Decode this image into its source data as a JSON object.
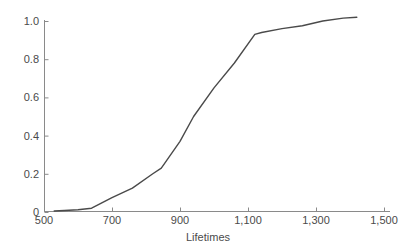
{
  "chart_data": {
    "type": "line",
    "title": "",
    "subtitle": "",
    "xlabel": "Lifetimes",
    "ylabel": "",
    "xlim": [
      500,
      1500
    ],
    "ylim": [
      0,
      1.04
    ],
    "grid": false,
    "legend": null,
    "legend_position": "none",
    "line_color": "#4a4a4a",
    "axis_color": "#8a8a8a",
    "x_ticks": [
      500,
      700,
      900,
      1100,
      1300,
      1500
    ],
    "x_tick_labels": [
      "500",
      "700",
      "900",
      "1,100",
      "1,300",
      "1,500"
    ],
    "y_ticks": [
      0,
      0.2,
      0.4,
      0.6,
      0.8,
      1.0
    ],
    "y_tick_labels": [
      "0",
      "0.2",
      "0.4",
      "0.6",
      "0.8",
      "1.0"
    ],
    "series": [
      {
        "name": "empirical cdf",
        "x": [
          530,
          560,
          600,
          640,
          700,
          760,
          820,
          845,
          900,
          940,
          1000,
          1060,
          1120,
          1140,
          1200,
          1260,
          1320,
          1380,
          1420
        ],
        "y": [
          0.005,
          0.008,
          0.012,
          0.02,
          0.075,
          0.125,
          0.2,
          0.23,
          0.37,
          0.5,
          0.65,
          0.78,
          0.93,
          0.94,
          0.96,
          0.975,
          1.0,
          1.015,
          1.02
        ]
      }
    ]
  },
  "axis_title": {
    "x": "Lifetimes"
  }
}
